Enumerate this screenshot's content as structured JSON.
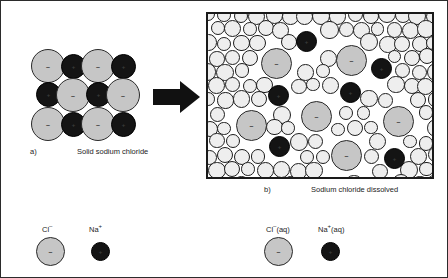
{
  "figure": {
    "border_color": "#2b2b2b"
  },
  "colors": {
    "chloride": "#c6c6c6",
    "sodium": "#141414",
    "water": "#eeeeee",
    "outline": "#1d1d1d",
    "arrow": "#111111"
  },
  "panel_a": {
    "letter": "a)",
    "caption": "Solid sodium chloride",
    "lattice": {
      "columns": 4,
      "rows": 3,
      "pattern": [
        [
          "Cl",
          "Na",
          "Cl",
          "Na"
        ],
        [
          "Na",
          "Cl",
          "Na",
          "Cl"
        ],
        [
          "Cl",
          "Na",
          "Cl",
          "Na"
        ]
      ],
      "ions": [
        {
          "species": "Cl",
          "sign": "–",
          "x": 0,
          "y": 0
        },
        {
          "species": "Na",
          "sign": "+",
          "x": 30,
          "y": 5
        },
        {
          "species": "Cl",
          "sign": "–",
          "x": 50,
          "y": 0
        },
        {
          "species": "Na",
          "sign": "+",
          "x": 80,
          "y": 5
        },
        {
          "species": "Na",
          "sign": "+",
          "x": 5,
          "y": 33
        },
        {
          "species": "Cl",
          "sign": "–",
          "x": 25,
          "y": 29
        },
        {
          "species": "Na",
          "sign": "+",
          "x": 55,
          "y": 33
        },
        {
          "species": "Cl",
          "sign": "–",
          "x": 75,
          "y": 29
        },
        {
          "species": "Cl",
          "sign": "–",
          "x": 0,
          "y": 58
        },
        {
          "species": "Na",
          "sign": "+",
          "x": 30,
          "y": 63
        },
        {
          "species": "Cl",
          "sign": "–",
          "x": 50,
          "y": 58
        },
        {
          "species": "Na",
          "sign": "+",
          "x": 80,
          "y": 63
        }
      ]
    }
  },
  "arrow": {
    "direction": "right",
    "meaning": "dissolves into"
  },
  "panel_b": {
    "letter": "b)",
    "caption": "Sodium chloride dissolved",
    "solvent": "water",
    "ions": [
      {
        "species": "Cl",
        "sign": "–",
        "x": 53,
        "y": 34,
        "size": 31
      },
      {
        "species": "Cl",
        "sign": "–",
        "x": 128,
        "y": 31,
        "size": 31
      },
      {
        "species": "Cl",
        "sign": "–",
        "x": 28,
        "y": 96,
        "size": 31
      },
      {
        "species": "Cl",
        "sign": "–",
        "x": 93,
        "y": 87,
        "size": 31
      },
      {
        "species": "Cl",
        "sign": "–",
        "x": 175,
        "y": 92,
        "size": 31
      },
      {
        "species": "Cl",
        "sign": "–",
        "x": 123,
        "y": 126,
        "size": 31
      },
      {
        "species": "Na",
        "sign": "+",
        "x": 88,
        "y": 17,
        "size": 21
      },
      {
        "species": "Na",
        "sign": "+",
        "x": 163,
        "y": 44,
        "size": 21
      },
      {
        "species": "Na",
        "sign": "+",
        "x": 60,
        "y": 71,
        "size": 21
      },
      {
        "species": "Na",
        "sign": "+",
        "x": 132,
        "y": 68,
        "size": 21
      },
      {
        "species": "Na",
        "sign": "+",
        "x": 61,
        "y": 122,
        "size": 21
      },
      {
        "species": "Na",
        "sign": "+",
        "x": 176,
        "y": 134,
        "size": 21
      }
    ]
  },
  "legend": {
    "items": [
      {
        "name": "chloride-solid",
        "label_main": "Cl",
        "label_sup": "–",
        "label_suffix": "",
        "species": "Cl"
      },
      {
        "name": "sodium-solid",
        "label_main": "Na",
        "label_sup": "+",
        "label_suffix": "",
        "species": "Na"
      },
      {
        "name": "chloride-aqueous",
        "label_main": "Cl",
        "label_sup": "–",
        "label_suffix": "(aq)",
        "species": "Cl"
      },
      {
        "name": "sodium-aqueous",
        "label_main": "Na",
        "label_sup": "+",
        "label_suffix": "(aq)",
        "species": "Na"
      }
    ]
  }
}
